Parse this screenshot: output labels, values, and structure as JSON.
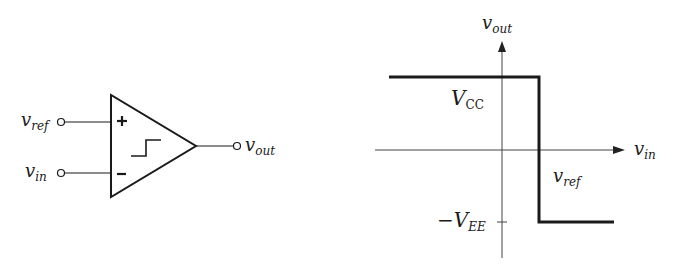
{
  "comparator": {
    "input_plus_label": {
      "main": "v",
      "sub": "ref"
    },
    "input_minus_label": {
      "main": "v",
      "sub": "in"
    },
    "output_label": {
      "main": "v",
      "sub": "out"
    },
    "plus_sign": "+",
    "minus_sign": "−"
  },
  "transfer_graph": {
    "y_axis_label": {
      "main": "v",
      "sub": "out"
    },
    "x_axis_label": {
      "main": "v",
      "sub": "in"
    },
    "high_level_label": {
      "main": "V",
      "sub": "CC"
    },
    "low_level_label": {
      "prefix": "−",
      "main": "V",
      "sub": "EE"
    },
    "threshold_label": {
      "main": "v",
      "sub": "ref"
    }
  },
  "colors": {
    "stroke": "#1a1a1a",
    "axis": "#444444",
    "background": "#ffffff"
  }
}
